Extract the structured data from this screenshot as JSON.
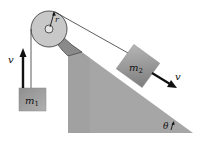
{
  "diagram": {
    "type": "physics-pulley-incline",
    "labels": {
      "radius": "r",
      "mass1": "m",
      "mass1_sub": "1",
      "mass2": "m",
      "mass2_sub": "2",
      "velocity1": "v",
      "velocity2": "v",
      "angle": "θ"
    },
    "colors": {
      "incline": "#a6a6a6",
      "pulley": "#c8c8c8",
      "block": "#9a9a9a",
      "rope": "#333333",
      "arrow": "#111111"
    }
  }
}
